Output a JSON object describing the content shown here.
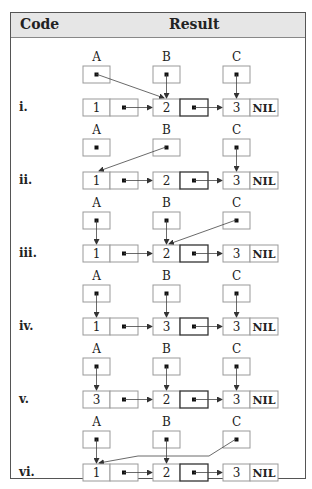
{
  "header": {
    "code": "Code",
    "result": "Result"
  },
  "pointer_names": [
    "A",
    "B",
    "C"
  ],
  "terminator": "NIL",
  "colors": {
    "border": "#555555",
    "header_bg": "#e6e6e6",
    "cell_border": "#999999",
    "highlight_border": "#333333",
    "ink": "#222222"
  },
  "rows": [
    {
      "label": "i.",
      "values": [
        "1",
        "2",
        "3"
      ],
      "targets": [
        "B",
        "B",
        "C"
      ],
      "notes": "A points to node 2, B points to node 2, C points to node 3"
    },
    {
      "label": "ii.",
      "values": [
        "1",
        "2",
        "3"
      ],
      "targets": [
        "none",
        "A",
        "C"
      ],
      "notes": "B points to node 1, C points to node 3, A points nowhere"
    },
    {
      "label": "iii.",
      "values": [
        "1",
        "2",
        "3"
      ],
      "targets": [
        "A",
        "B",
        "B"
      ],
      "notes": "A points to node 1, B to node 2, C to node 2"
    },
    {
      "label": "iv.",
      "values": [
        "1",
        "3",
        "3"
      ],
      "targets": [
        "A",
        "B",
        "C"
      ],
      "notes": "A, B, C point to nodes 1, 2, 3"
    },
    {
      "label": "v.",
      "values": [
        "3",
        "2",
        "3"
      ],
      "targets": [
        "A",
        "B",
        "C"
      ],
      "notes": "A, B, C point to nodes 1, 2, 3"
    },
    {
      "label": "vi.",
      "values": [
        "1",
        "2",
        "3"
      ],
      "targets": [
        "A",
        "B",
        "A"
      ],
      "notes": "A to node 1, B to node 2, C to node 1"
    }
  ]
}
